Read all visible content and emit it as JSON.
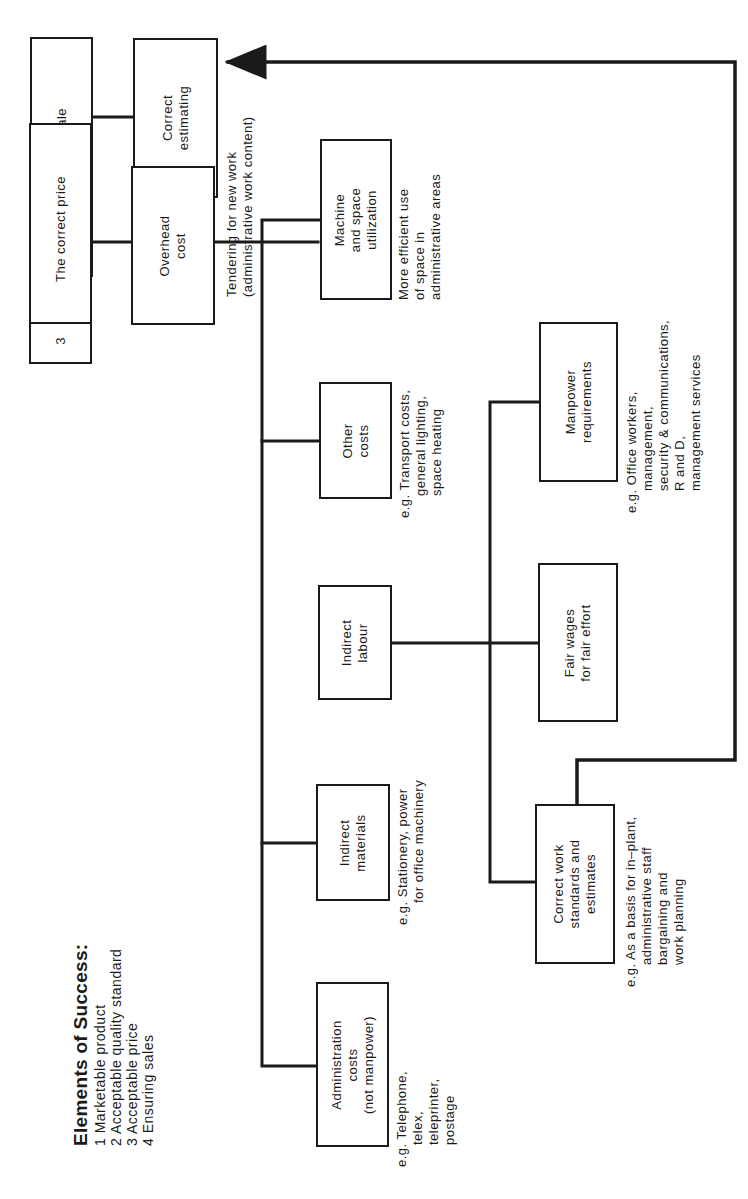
{
  "orientation": "rotated -90deg (text reads bottom-to-top)",
  "colors": {
    "ink": "#1a1a1a",
    "paper": "#ffffff"
  },
  "legend": {
    "title": "Elements of Success:",
    "items": [
      "1 Marketable product",
      "2 Acceptable quality standard",
      "3 Acceptable price",
      "4 Ensuring sales"
    ]
  },
  "element_boxes": [
    {
      "number": "4",
      "label": "Ready sale"
    },
    {
      "number": "3",
      "label": "The correct price"
    }
  ],
  "nodes": {
    "correct_estimating": {
      "lines": [
        "Correct",
        "estimating"
      ]
    },
    "overhead_cost": {
      "lines": [
        "Overhead",
        "cost"
      ]
    },
    "machine_space": {
      "lines": [
        "Machine",
        "and space",
        "utilization"
      ]
    },
    "other_costs": {
      "lines": [
        "Other",
        "costs"
      ]
    },
    "indirect_labour": {
      "lines": [
        "Indirect",
        "labour"
      ]
    },
    "indirect_materials": {
      "lines": [
        "Indirect",
        "materials"
      ]
    },
    "admin_costs": {
      "lines": [
        "Administration",
        "costs",
        "(not manpower)"
      ]
    },
    "manpower": {
      "lines": [
        "Manpower",
        "requirements"
      ]
    },
    "fair_wages": {
      "lines": [
        "Fair wages",
        "for fair effort"
      ]
    },
    "work_standards": {
      "lines": [
        "Correct work",
        "standards and",
        "estimates"
      ]
    }
  },
  "annotations": {
    "tendering": [
      "Tendering for new work",
      "(administrative work content)"
    ],
    "machine_space": [
      "More efficient use",
      "of space in",
      "administrative areas"
    ],
    "other_costs": [
      "e.g. Transport costs,",
      "general lighting,",
      "space heating"
    ],
    "manpower": [
      "e.g. Office workers,",
      "management,",
      "security & communications,",
      "R and D,",
      "management services"
    ],
    "indirect_materials": [
      "e.g. Stationery, power",
      "for office machinery"
    ],
    "admin_costs": [
      "e.g. Telephone,",
      "telex,",
      "teleprinter,",
      "postage"
    ],
    "work_standards": [
      "e.g. As a basis for in–plant,",
      "administrative staff",
      "bargaining and",
      "work planning"
    ]
  }
}
